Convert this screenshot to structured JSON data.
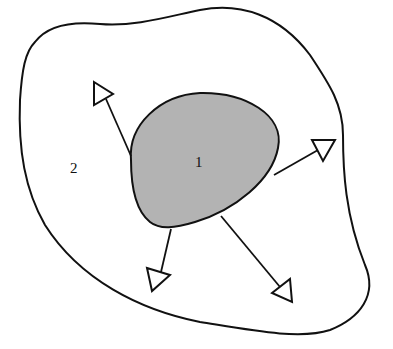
{
  "diagram": {
    "regions": [
      {
        "id": "region-1",
        "label": "1",
        "fill": "#b3b3b3",
        "description": "inner shaded region"
      },
      {
        "id": "region-2",
        "label": "2",
        "fill": "#ffffff",
        "description": "outer region"
      }
    ],
    "arrows": [
      {
        "direction": "up-left"
      },
      {
        "direction": "right"
      },
      {
        "direction": "down"
      },
      {
        "direction": "down-right"
      }
    ],
    "colors": {
      "stroke": "#111111",
      "inner_fill": "#b3b3b3",
      "background": "#ffffff"
    }
  }
}
